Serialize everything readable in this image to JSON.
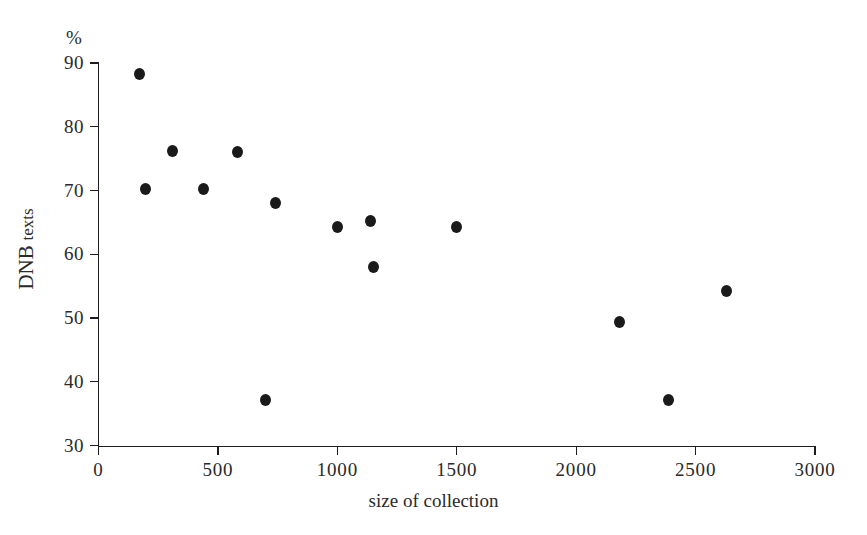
{
  "chart_data": {
    "type": "scatter",
    "title": "",
    "xlabel": "size of collection",
    "ylabel": "DNB texts",
    "yunit": "%",
    "xlim": [
      0,
      3000
    ],
    "ylim": [
      30,
      90
    ],
    "xticks": [
      0,
      500,
      1000,
      1500,
      2000,
      2500,
      3000
    ],
    "xticklabels": [
      "0",
      "500",
      "1000",
      "1500",
      "2000",
      "2500",
      "3000"
    ],
    "yticks": [
      30,
      40,
      50,
      60,
      70,
      80,
      90
    ],
    "yticklabels": [
      "30",
      "40",
      "50",
      "60",
      "70",
      "80",
      "90"
    ],
    "grid": false,
    "legend": null,
    "marker": "filled-circle",
    "marker_color": "#1a1a1a",
    "points": [
      {
        "x": 170,
        "y": 88.2
      },
      {
        "x": 195,
        "y": 70.2
      },
      {
        "x": 310,
        "y": 76.2
      },
      {
        "x": 440,
        "y": 70.2
      },
      {
        "x": 580,
        "y": 76.0
      },
      {
        "x": 700,
        "y": 37.2
      },
      {
        "x": 740,
        "y": 68.0
      },
      {
        "x": 1000,
        "y": 64.2
      },
      {
        "x": 1140,
        "y": 65.2
      },
      {
        "x": 1150,
        "y": 58.0
      },
      {
        "x": 1500,
        "y": 64.2
      },
      {
        "x": 2180,
        "y": 49.3
      },
      {
        "x": 2385,
        "y": 37.1
      },
      {
        "x": 2630,
        "y": 54.2
      }
    ]
  },
  "axis": {
    "percent_symbol": "%",
    "y_title_main": "DNB",
    "y_title_sub": "texts",
    "x_title": "size of collection"
  },
  "style": {
    "background": "#ffffff",
    "ink": "#1a1a1a",
    "axis_color": "#1c1c1c"
  }
}
